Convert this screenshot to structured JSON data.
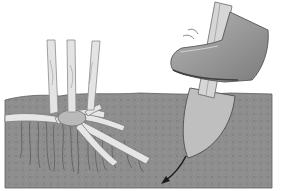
{
  "figure": {
    "description": "Illustration: a booted foot pushes a spade into soil beside a plant crown with stems and spreading rhizome roots; an arrow shows the spade blade direction.",
    "elements": {
      "soil": "soil-cross-section",
      "plant": "plant-crown-with-stems-and-rhizomes",
      "spade": "spade-blade-in-soil",
      "boot": "boot-on-spade",
      "arrow": "direction-arrow"
    }
  },
  "colors": {
    "background": "#ffffff",
    "soil": "#8e8e8e",
    "soil_dark": "#6f6f6f",
    "soil_speckle": "#7a7a7a",
    "spade_blade": "#bdbdbd",
    "stem": "#e4e4e4",
    "stem_outline": "#8a8a8a",
    "boot": "#a8a8a8",
    "boot_dark": "#6c6c6c",
    "arrow": "#1a1a1a"
  }
}
